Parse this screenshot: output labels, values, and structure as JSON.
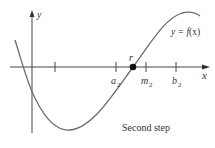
{
  "diagram": {
    "title": "Second step",
    "function_label": "y = f(x)",
    "function_label_parts": {
      "lhs": "y = ",
      "fn": "f",
      "arg": "(x)"
    },
    "axes": {
      "x_label": "x",
      "y_label": "y"
    },
    "ticks": [
      {
        "id": "tick-1",
        "label": ""
      },
      {
        "id": "a2",
        "label": "a",
        "sub": "2"
      },
      {
        "id": "m2",
        "label": "m",
        "sub": "2"
      },
      {
        "id": "b2",
        "label": "b",
        "sub": "2"
      }
    ],
    "root": {
      "label": "r"
    },
    "colors": {
      "curve": "#6b6b6b",
      "axis": "#444444",
      "point": "#111111",
      "text": "#333333"
    }
  }
}
